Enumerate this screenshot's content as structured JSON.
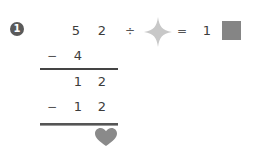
{
  "problem": {
    "number": "1",
    "equation": {
      "dividend_digits": [
        "5",
        "2"
      ],
      "divide_symbol": "÷",
      "divisor_placeholder": "star-shape",
      "equals_symbol": "=",
      "quotient_known_digit": "1",
      "quotient_placeholder": "square-shape"
    },
    "long_division": {
      "step1": {
        "operator": "−",
        "digits": [
          "4"
        ]
      },
      "remainder1": {
        "digits": [
          "1",
          "2"
        ]
      },
      "step2": {
        "operator": "−",
        "digits": [
          "1",
          "2"
        ]
      },
      "result_placeholder": "heart-shape"
    }
  },
  "colors": {
    "text": "#3c3c3c",
    "badge": "#5a5a5a",
    "star": "#c8c8c8",
    "square": "#858585",
    "heart": "#8a8a8a",
    "rule": "#444444"
  }
}
